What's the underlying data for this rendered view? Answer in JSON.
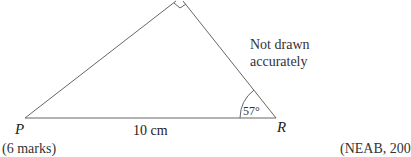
{
  "diagram": {
    "type": "right-angled triangle",
    "vertices": [
      {
        "name": "P",
        "label": "P"
      },
      {
        "name": "Q",
        "label": "",
        "right_angle": true
      },
      {
        "name": "R",
        "label": "R"
      }
    ],
    "side_PR_label": "10 cm",
    "angle_R_label": "57°",
    "note": {
      "line1": "Not drawn",
      "line2": "accurately"
    },
    "colors": {
      "line": "#555555",
      "text": "#222222",
      "background": "#ffffff"
    }
  },
  "footer": {
    "marks": "(6 marks)",
    "source": "(NEAB, 200"
  }
}
